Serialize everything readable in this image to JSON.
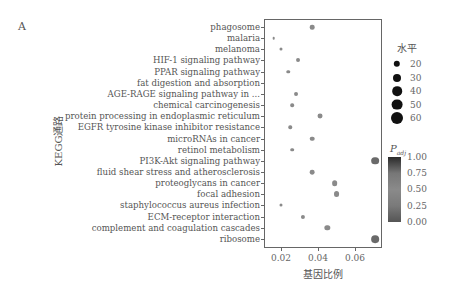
{
  "panel_label": "A",
  "chart_data": {
    "type": "scatter",
    "title": "",
    "xlabel": "基因比例",
    "ylabel": "KEGG通路",
    "xlim": [
      0.0115,
      0.0745
    ],
    "xticks": [
      0.02,
      0.04,
      0.06
    ],
    "xtick_labels": [
      "0.02",
      "0.04",
      "0.06"
    ],
    "grid": false,
    "categories": [
      "phagosome",
      "malaria",
      "melanoma",
      "HIF-1 signaling pathway",
      "PPAR signaling pathway",
      "fat digestion and absorption",
      "AGE-RAGE signaling pathway in ...",
      "chemical carcinogenesis",
      "protein processing in endoplasmic reticulum",
      "EGFR tyrosine kinase inhibitor resistance",
      "microRNAs in cancer",
      "retinol metabolism",
      "PI3K-Akt signaling pathway",
      "fluid shear stress and atherosclerosis",
      "proteoglycans in cancer",
      "focal adhesion",
      "staphylococcus aureus infection",
      "ECM-receptor interaction",
      "complement and coagulation cascades",
      "ribosome"
    ],
    "points": [
      {
        "pathway": "phagosome",
        "gene_ratio": 0.037,
        "count": 30,
        "padj": 0.5
      },
      {
        "pathway": "malaria",
        "gene_ratio": 0.016,
        "count": 12,
        "padj": 0.5
      },
      {
        "pathway": "melanoma",
        "gene_ratio": 0.02,
        "count": 16,
        "padj": 0.5
      },
      {
        "pathway": "HIF-1 signaling pathway",
        "gene_ratio": 0.029,
        "count": 24,
        "padj": 0.5
      },
      {
        "pathway": "PPAR signaling pathway",
        "gene_ratio": 0.024,
        "count": 20,
        "padj": 0.5
      },
      {
        "pathway": "fat digestion and absorption",
        "gene_ratio": null,
        "count": null,
        "padj": null
      },
      {
        "pathway": "AGE-RAGE signaling pathway in ...",
        "gene_ratio": 0.028,
        "count": 24,
        "padj": 0.5
      },
      {
        "pathway": "chemical carcinogenesis",
        "gene_ratio": 0.026,
        "count": 21,
        "padj": 0.5
      },
      {
        "pathway": "protein processing in endoplasmic reticulum",
        "gene_ratio": 0.041,
        "count": 33,
        "padj": 0.5
      },
      {
        "pathway": "EGFR tyrosine kinase inhibitor resistance",
        "gene_ratio": 0.025,
        "count": 20,
        "padj": 0.5
      },
      {
        "pathway": "microRNAs in cancer",
        "gene_ratio": 0.037,
        "count": 30,
        "padj": 0.5
      },
      {
        "pathway": "retinol metabolism",
        "gene_ratio": 0.026,
        "count": 21,
        "padj": 0.5
      },
      {
        "pathway": "PI3K-Akt signaling pathway",
        "gene_ratio": 0.071,
        "count": 58,
        "padj": 0.6
      },
      {
        "pathway": "fluid shear stress and atherosclerosis",
        "gene_ratio": 0.037,
        "count": 31,
        "padj": 0.5
      },
      {
        "pathway": "proteoglycans in cancer",
        "gene_ratio": 0.049,
        "count": 40,
        "padj": 0.5
      },
      {
        "pathway": "focal adhesion",
        "gene_ratio": 0.05,
        "count": 42,
        "padj": 0.5
      },
      {
        "pathway": "staphylococcus aureus infection",
        "gene_ratio": 0.02,
        "count": 16,
        "padj": 0.5
      },
      {
        "pathway": "ECM-receptor interaction",
        "gene_ratio": 0.032,
        "count": 26,
        "padj": 0.5
      },
      {
        "pathway": "complement and coagulation cascades",
        "gene_ratio": 0.045,
        "count": 37,
        "padj": 0.5
      },
      {
        "pathway": "ribosome",
        "gene_ratio": 0.071,
        "count": 58,
        "padj": 0.6
      }
    ],
    "size_legend": {
      "title": "水平",
      "values": [
        "20",
        "30",
        "40",
        "50",
        "60"
      ]
    },
    "color_legend": {
      "title": "P",
      "title_sub": "adj",
      "ticks": [
        "1.00",
        "0.75",
        "0.50",
        "0.25",
        "0.00"
      ]
    }
  }
}
